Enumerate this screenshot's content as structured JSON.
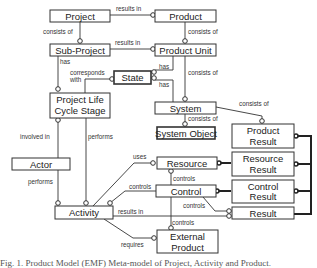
{
  "diagram": {
    "entities": {
      "project": "Project",
      "product": "Product",
      "sub_project": "Sub-Project",
      "product_unit": "Product Unit",
      "state": "State",
      "plcs_line1": "Project Life",
      "plcs_line2": "Cycle Stage",
      "system": "System",
      "system_object": "System Object",
      "actor": "Actor",
      "product_result_line1": "Product",
      "product_result_line2": "Result",
      "resource": "Resource",
      "resource_result_line1": "Resource",
      "resource_result_line2": "Result",
      "control": "Control",
      "control_result_line1": "Control",
      "control_result_line2": "Result",
      "activity": "Activity",
      "result": "Result",
      "external_product_line1": "External",
      "external_product_line2": "Product"
    },
    "relations": {
      "project_results_in": "results in",
      "project_consists_of": "consists of",
      "product_consists_of": "consists of",
      "subproject_results_in": "results in",
      "subproject_has": "has",
      "corresponds_line1": "corresponds",
      "corresponds_line2": "with",
      "unit_has_1": "has",
      "unit_has_2": "has",
      "unit_consists_of": "consists of",
      "system_consists_of_object": "consists of",
      "system_consists_of_result": "consists of",
      "involved_in": "involved in",
      "plcs_performs": "performs",
      "actor_performs": "performs",
      "uses": "uses",
      "resource_controls": "controls",
      "activity_controls": "controls",
      "control_controls_result": "controls",
      "control_controls_external": "controls",
      "activity_results_in": "results in",
      "requires": "requires"
    }
  },
  "caption": "Fig. 1. Product Model (EMF) Meta-model of Project, Activity and Product."
}
